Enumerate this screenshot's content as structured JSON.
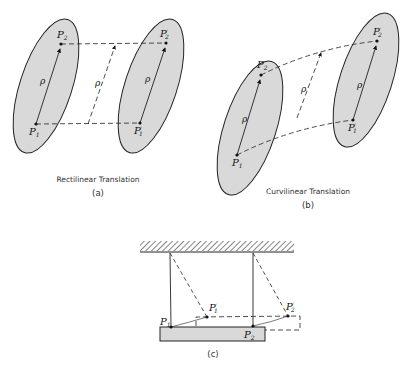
{
  "figure": {
    "panels": [
      {
        "id": "a",
        "caption": "Rectilinear Translation",
        "label": "(a)",
        "points": {
          "p1": "P",
          "p1_sub": "1",
          "p2": "P",
          "p2_sub": "2",
          "p1p": "P",
          "p1p_sub": "1",
          "p1p_prime": "′",
          "p2p": "P",
          "p2p_sub": "2",
          "p2p_prime": "′"
        },
        "vector_label": "ρ"
      },
      {
        "id": "b",
        "caption": "Curvilinear Translation",
        "label": "(b)",
        "points": {
          "p1": "P",
          "p1_sub": "1",
          "p2": "P",
          "p2_sub": "2",
          "p1p": "P",
          "p1p_sub": "1",
          "p1p_prime": "′",
          "p2p": "P",
          "p2p_sub": "2",
          "p2p_prime": "′"
        },
        "vector_label": "ρ"
      },
      {
        "id": "c",
        "caption": "",
        "label": "(c)",
        "points": {
          "p1": "P",
          "p1_sub": "1",
          "p2": "P",
          "p2_sub": "2",
          "p1p": "P",
          "p1p_sub": "1",
          "p1p_prime": "′",
          "p2p": "P",
          "p2p_sub": "2",
          "p2p_prime": "′"
        }
      }
    ],
    "colors": {
      "body_fill": "#d9d9d9",
      "stroke": "#222222",
      "background": "#ffffff"
    }
  }
}
